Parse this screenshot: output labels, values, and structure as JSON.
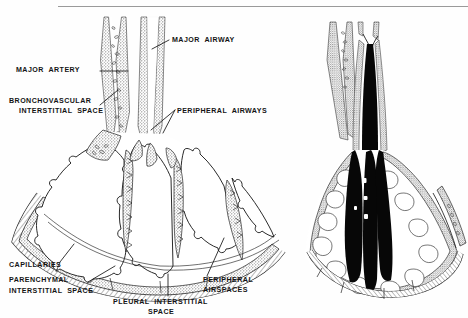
{
  "figure": {
    "top_rule": {
      "x1": 58,
      "x2": 468,
      "y": 6
    },
    "panels": [
      {
        "id": "left-panel",
        "name": "normal-lung-cross-section",
        "state": "air-filled",
        "labeled": true
      },
      {
        "id": "right-panel",
        "name": "edematous-lung-cross-section",
        "state": "fluid-filled",
        "labeled": false
      }
    ]
  },
  "labels": [
    {
      "key": "major_airway",
      "text": "MAJOR  AIRWAY",
      "x": 172,
      "y": 41,
      "align": "left"
    },
    {
      "key": "major_artery",
      "text": "MAJOR  ARTERY",
      "x": 16,
      "y": 74,
      "align": "left"
    },
    {
      "key": "bronchovascular_line1",
      "text": "BRONCHOVASCULAR",
      "x": 10,
      "y": 102,
      "align": "left"
    },
    {
      "key": "bronchovascular_line2",
      "text": "INTERSTITIAL  SPACE",
      "x": 18,
      "y": 111,
      "align": "left"
    },
    {
      "key": "peripheral_airways",
      "text": "PERIPHERAL  AIRWAYS",
      "x": 177,
      "y": 112,
      "align": "left"
    },
    {
      "key": "capillaries",
      "text": "CAPILLARIES",
      "x": 10,
      "y": 266,
      "align": "left"
    },
    {
      "key": "parenchymal_line1",
      "text": "PARENCHYMAL",
      "x": 10,
      "y": 281,
      "align": "left"
    },
    {
      "key": "parenchymal_line2",
      "text": "INTERSTITIAL  SPACE",
      "x": 10,
      "y": 291,
      "align": "left"
    },
    {
      "key": "peripheral_airspaces_line1",
      "text": "PERIPHERAL",
      "x": 203,
      "y": 280,
      "align": "left"
    },
    {
      "key": "peripheral_airspaces_line2",
      "text": "AIRSPACES",
      "x": 203,
      "y": 289,
      "align": "left"
    },
    {
      "key": "pleural_line1",
      "text": "PLEURAL  INTERSTITIAL",
      "x": 113,
      "y": 301,
      "align": "left"
    },
    {
      "key": "pleural_line2",
      "text": "SPACE",
      "x": 148,
      "y": 310,
      "align": "left"
    }
  ],
  "colors": {
    "ink": "#141414",
    "line": "#1a1a1a",
    "stipple": "#8d8d8d",
    "stipple_light": "#b4b4b4",
    "fluid": "#070707",
    "airspace": "#ffffff",
    "rule": "#9a9a9a",
    "background": "#fefefe"
  }
}
